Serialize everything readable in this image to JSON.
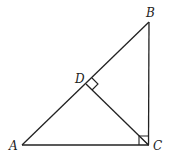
{
  "diagram": {
    "type": "geometry",
    "stroke_color": "#222222",
    "background": "#ffffff",
    "points": {
      "A": {
        "label": "A",
        "x": 22,
        "y": 145
      },
      "B": {
        "label": "B",
        "x": 149,
        "y": 22
      },
      "C": {
        "label": "C",
        "x": 148,
        "y": 145
      },
      "D": {
        "label": "D",
        "x": 86,
        "y": 84
      }
    },
    "segments": [
      "AB",
      "BC",
      "CA",
      "CD"
    ],
    "right_angles": [
      "ACB",
      "CDB"
    ]
  }
}
